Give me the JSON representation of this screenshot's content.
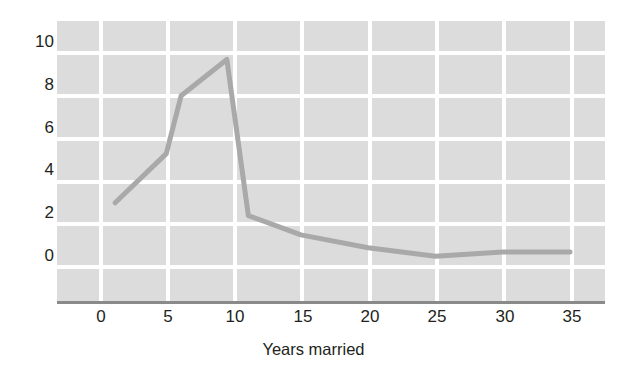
{
  "chart_data": {
    "type": "line",
    "title": "",
    "subtitle": "",
    "xlabel": "Years married",
    "ylabel": "Percent of divorces",
    "xlim": [
      -1.5,
      38
    ],
    "ylim": [
      -0.55,
      10.8
    ],
    "xticks": [
      0,
      5,
      10,
      15,
      20,
      25,
      30,
      35
    ],
    "xtick_labels": [
      "0",
      "5",
      "10",
      "15",
      "20",
      "25",
      "30",
      "35"
    ],
    "yticks": [
      0,
      2,
      4,
      6,
      8,
      10
    ],
    "ytick_labels": [
      "0",
      "2",
      "4",
      "6",
      "8",
      "10"
    ],
    "grid": true,
    "grid_color": "#ffffff",
    "plot_background": "#dcdcdc",
    "figure_background": "#ffffff",
    "legend": false,
    "legend_position": "none",
    "annotations": [],
    "series": [
      {
        "name": "Percent of divorces",
        "color": "#a9a9a9",
        "line_width": 5,
        "x": [
          1.2,
          5.0,
          6.1,
          9.5,
          11.1,
          15.0,
          20.0,
          25.0,
          30.0,
          35.0
        ],
        "y": [
          3.0,
          5.3,
          8.0,
          9.7,
          2.4,
          1.5,
          0.9,
          0.5,
          0.7,
          0.7
        ]
      }
    ]
  },
  "axes": {
    "y_title": "Percent of divorces",
    "x_title": "Years married",
    "axis_line_color": "#8a8a8a"
  }
}
